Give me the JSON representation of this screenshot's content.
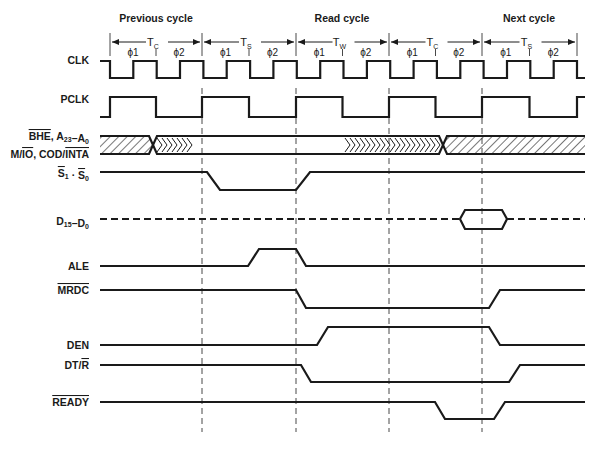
{
  "cycles": [
    {
      "label": "Previous cycle",
      "x": 156
    },
    {
      "label": "Read cycle",
      "x": 342
    },
    {
      "label": "Next cycle",
      "x": 529
    }
  ],
  "states": [
    {
      "name": "T",
      "sub": "C",
      "x0": 110,
      "x1": 202
    },
    {
      "name": "T",
      "sub": "S",
      "x0": 202,
      "x1": 296
    },
    {
      "name": "T",
      "sub": "W",
      "x0": 296,
      "x1": 389
    },
    {
      "name": "T",
      "sub": "C",
      "x0": 389,
      "x1": 482
    },
    {
      "name": "T",
      "sub": "S",
      "x0": 482,
      "x1": 577
    }
  ],
  "phases": [
    "ϕ1",
    "ϕ2",
    "ϕ1",
    "ϕ2",
    "ϕ1",
    "ϕ2",
    "ϕ1",
    "ϕ2",
    "ϕ1",
    "ϕ2"
  ],
  "boundaries": [
    110,
    202,
    296,
    389,
    482,
    577
  ],
  "guides": [
    202,
    296,
    389,
    482
  ],
  "signals": [
    {
      "id": "clk",
      "label": "CLK"
    },
    {
      "id": "pclk",
      "label": "PCLK"
    },
    {
      "id": "addr1",
      "label": "BHE, A23–A0",
      "parts": [
        {
          "t": "BHE",
          "over": true
        },
        {
          "t": ", A"
        },
        {
          "t": "23",
          "sub": true
        },
        {
          "t": "–A"
        },
        {
          "t": "0",
          "sub": true
        }
      ]
    },
    {
      "id": "addr2",
      "label": "M/IO, COD/INTA",
      "parts": [
        {
          "t": "M/"
        },
        {
          "t": "IO",
          "over": true
        },
        {
          "t": ", COD/"
        },
        {
          "t": "INTA",
          "over": true
        }
      ]
    },
    {
      "id": "status",
      "label": "S1 · S0",
      "parts": [
        {
          "t": "S",
          "over": true
        },
        {
          "t": "1",
          "sub": true
        },
        {
          "t": " · "
        },
        {
          "t": "S",
          "over": true
        },
        {
          "t": "0",
          "sub": true
        }
      ]
    },
    {
      "id": "data",
      "label": "D15–D0",
      "parts": [
        {
          "t": "D"
        },
        {
          "t": "15",
          "sub": true
        },
        {
          "t": "–D"
        },
        {
          "t": "0",
          "sub": true
        }
      ]
    },
    {
      "id": "ale",
      "label": "ALE"
    },
    {
      "id": "mrdc",
      "label": "MRDC",
      "over": true
    },
    {
      "id": "den",
      "label": "DEN"
    },
    {
      "id": "dtr",
      "label": "DT/R",
      "parts": [
        {
          "t": "DT/"
        },
        {
          "t": "R",
          "over": true
        }
      ]
    },
    {
      "id": "ready",
      "label": "READY",
      "over": true
    }
  ],
  "waveforms": {
    "clk": {
      "hi": 61,
      "lo": 78,
      "start": 110,
      "half": 23.35,
      "end": 585
    },
    "pclk": {
      "hi": 97,
      "lo": 117
    },
    "addr": {
      "top": 136,
      "bot": 154,
      "x0": 100,
      "x1": 585,
      "cross1": 153,
      "chev_end": 192,
      "chev2_start": 345,
      "cross2": 443
    },
    "status": "M100,172 L207,172 L220,190 L296,190 L310,172 L585,172",
    "data": {
      "y": 219,
      "x0": 100,
      "x1": 585,
      "hex": [
        460,
        507
      ],
      "hi": 210,
      "lo": 229
    },
    "ale": "M100,266 L248,266 L259,249 L296,249 L306,266 L585,266",
    "mrdc": "M100,290 L296,290 L306,308 L489,308 L500,290 L585,290",
    "den": "M100,345 L317,345 L328,327 L489,327 L500,345 L585,345",
    "dtr": "M100,365 L301,365 L311,382 L509,382 L520,365 L585,365",
    "ready": "M100,402 L435,402 L445,419 L494,419 L505,402 L585,402"
  }
}
